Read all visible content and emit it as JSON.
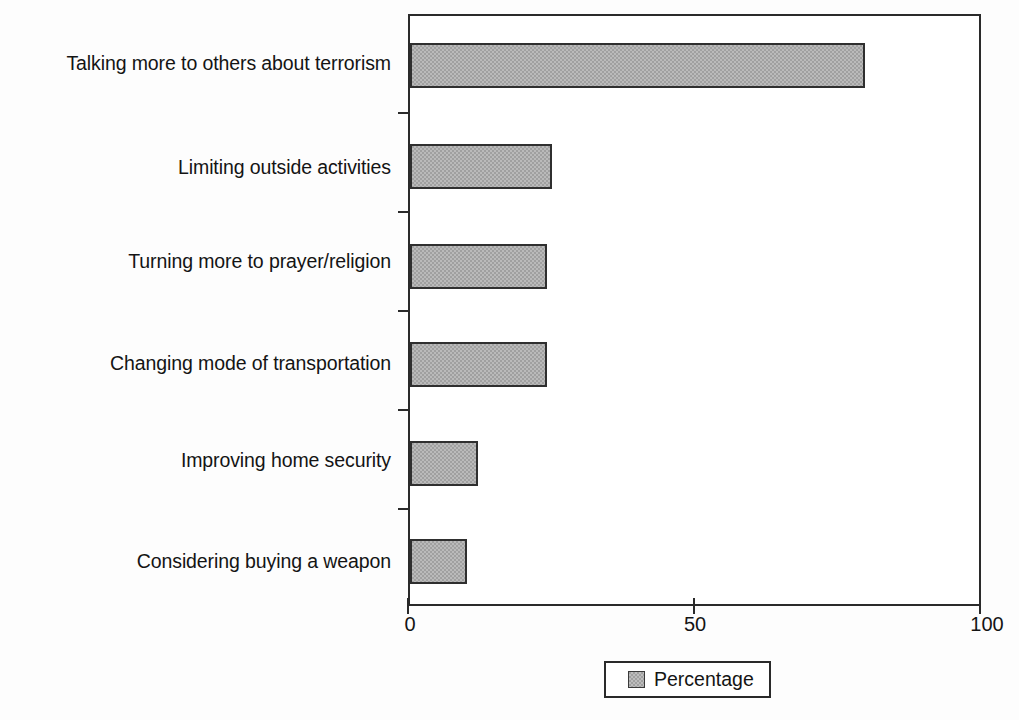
{
  "chart_data": {
    "type": "bar",
    "orientation": "horizontal",
    "title": "",
    "subtitle": "",
    "xlabel": "",
    "ylabel": "",
    "xlim": [
      0,
      100
    ],
    "xticks": [
      "0",
      "50",
      "100"
    ],
    "xtick_values": [
      0,
      50,
      100
    ],
    "grid": false,
    "legend_position": "bottom",
    "categories": [
      "Talking more to others about terrorism",
      "Limiting outside activities",
      "Turning more to prayer/religion",
      "Changing mode of transportation",
      "Improving home security",
      "Considering buying a weapon"
    ],
    "series": [
      {
        "name": "Percentage",
        "values": [
          80,
          25,
          24,
          24,
          12,
          10
        ]
      }
    ],
    "colors": {
      "bar_fill": "#a0a0a0",
      "bar_border": "#2f2f2f",
      "axis": "#2a2a2a",
      "text": "#141414",
      "background": "#fdfdfd"
    }
  },
  "legend": {
    "entries": [
      {
        "label": "Percentage",
        "swatch_color": "#a0a0a0"
      }
    ]
  }
}
